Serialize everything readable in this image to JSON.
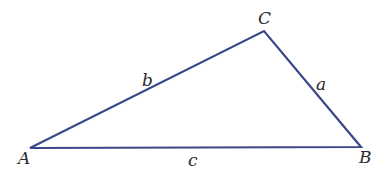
{
  "diagram": {
    "type": "triangle",
    "stroke_color": "#3b4787",
    "stroke_width": 2.2,
    "vertices": {
      "A": {
        "label": "A",
        "x": 30,
        "y": 148,
        "label_x": 18,
        "label_y": 164
      },
      "B": {
        "label": "B",
        "x": 361,
        "y": 147,
        "label_x": 359,
        "label_y": 163
      },
      "C": {
        "label": "C",
        "x": 264,
        "y": 31,
        "label_x": 258,
        "label_y": 24
      }
    },
    "sides": {
      "a": {
        "label": "a",
        "from": "B",
        "to": "C",
        "label_x": 316,
        "label_y": 90
      },
      "b": {
        "label": "b",
        "from": "A",
        "to": "C",
        "label_x": 142,
        "label_y": 86
      },
      "c": {
        "label": "c",
        "from": "A",
        "to": "B",
        "label_x": 188,
        "label_y": 166
      }
    }
  }
}
